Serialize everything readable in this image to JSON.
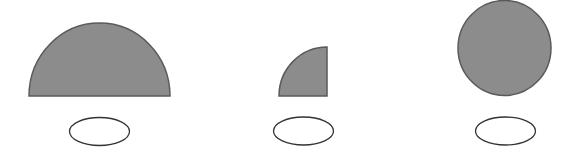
{
  "diagram": {
    "colors": {
      "fill": "#8c8c8c",
      "stroke": "#5a5a5a",
      "oval_stroke": "#333333",
      "background": "#ffffff"
    },
    "shapes": [
      {
        "id": "semicircle",
        "label": "half circle",
        "oval_value": ""
      },
      {
        "id": "quarter-circle",
        "label": "quarter circle",
        "oval_value": ""
      },
      {
        "id": "full-circle",
        "label": "whole circle",
        "oval_value": ""
      }
    ]
  }
}
